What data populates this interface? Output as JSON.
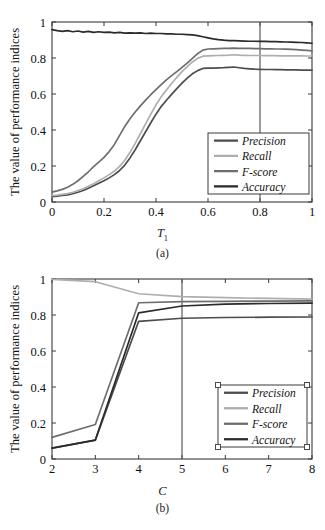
{
  "figure": {
    "ylabel": "The value of performance indices",
    "series_names": [
      "Precision",
      "Recall",
      "F-score",
      "Accuracy"
    ],
    "colors": {
      "precision": "#4d4d4d",
      "recall": "#aeaeae",
      "fscore": "#6e6e6e",
      "accuracy": "#2b2b2b",
      "axis": "#3a3a3a",
      "marker_line": "#5a5a5a",
      "handle_fill": "#ffffff",
      "handle_stroke": "#4a4a4a"
    }
  },
  "chart_data": [
    {
      "type": "line",
      "panel": "(a)",
      "title": "",
      "xlabel": "T1",
      "xlabel_display": "T",
      "xlabel_sub": "1",
      "ylabel": "The value of performance indices",
      "xlim": [
        0,
        1
      ],
      "ylim": [
        0,
        1
      ],
      "xticks": [
        0,
        0.2,
        0.4,
        0.6,
        0.8,
        1
      ],
      "xticklabels": [
        "0",
        "0.2",
        "0.4",
        "0.6",
        "0.8",
        "1"
      ],
      "yticks": [
        0,
        0.2,
        0.4,
        0.6,
        0.8,
        1
      ],
      "yticklabels": [
        "0",
        "0.2",
        "0.4",
        "0.6",
        "0.8",
        "1"
      ],
      "grid": false,
      "legend_position": "lower right",
      "legend_entries": [
        "Precision",
        "Recall",
        "F-score",
        "Accuracy"
      ],
      "annotations": [
        {
          "type": "vertical-line",
          "x": 0.8,
          "label": "0.8"
        }
      ],
      "x": [
        0,
        0.02,
        0.04,
        0.06,
        0.08,
        0.1,
        0.12,
        0.14,
        0.16,
        0.18,
        0.2,
        0.22,
        0.24,
        0.26,
        0.28,
        0.3,
        0.32,
        0.34,
        0.36,
        0.38,
        0.4,
        0.42,
        0.44,
        0.46,
        0.48,
        0.5,
        0.52,
        0.54,
        0.56,
        0.58,
        0.6,
        0.62,
        0.64,
        0.66,
        0.68,
        0.7,
        0.72,
        0.74,
        0.76,
        0.78,
        0.8,
        0.82,
        0.84,
        0.86,
        0.88,
        0.9,
        0.92,
        0.94,
        0.96,
        0.98,
        1.0
      ],
      "series": [
        {
          "name": "Precision",
          "color": "#4d4d4d",
          "values": [
            0.03,
            0.033,
            0.036,
            0.04,
            0.046,
            0.054,
            0.064,
            0.076,
            0.09,
            0.104,
            0.118,
            0.134,
            0.152,
            0.175,
            0.205,
            0.245,
            0.29,
            0.34,
            0.39,
            0.44,
            0.488,
            0.53,
            0.565,
            0.598,
            0.63,
            0.66,
            0.688,
            0.712,
            0.73,
            0.742,
            0.744,
            0.744,
            0.745,
            0.746,
            0.748,
            0.75,
            0.746,
            0.742,
            0.74,
            0.738,
            0.737,
            0.736,
            0.736,
            0.735,
            0.735,
            0.734,
            0.734,
            0.734,
            0.733,
            0.733,
            0.733
          ]
        },
        {
          "name": "Recall",
          "color": "#aeaeae",
          "values": [
            0.035,
            0.038,
            0.042,
            0.047,
            0.054,
            0.063,
            0.074,
            0.087,
            0.102,
            0.118,
            0.134,
            0.152,
            0.172,
            0.198,
            0.232,
            0.276,
            0.326,
            0.38,
            0.434,
            0.488,
            0.54,
            0.584,
            0.622,
            0.658,
            0.692,
            0.724,
            0.752,
            0.778,
            0.798,
            0.81,
            0.812,
            0.813,
            0.814,
            0.815,
            0.816,
            0.818,
            0.816,
            0.815,
            0.814,
            0.814,
            0.814,
            0.813,
            0.813,
            0.813,
            0.812,
            0.812,
            0.812,
            0.812,
            0.812,
            0.811,
            0.811
          ]
        },
        {
          "name": "F-score",
          "color": "#6e6e6e",
          "values": [
            0.055,
            0.062,
            0.07,
            0.082,
            0.098,
            0.118,
            0.142,
            0.168,
            0.196,
            0.222,
            0.248,
            0.28,
            0.32,
            0.37,
            0.42,
            0.462,
            0.5,
            0.534,
            0.566,
            0.596,
            0.624,
            0.652,
            0.678,
            0.702,
            0.724,
            0.748,
            0.772,
            0.798,
            0.824,
            0.844,
            0.85,
            0.851,
            0.852,
            0.853,
            0.854,
            0.855,
            0.854,
            0.853,
            0.853,
            0.852,
            0.852,
            0.851,
            0.851,
            0.85,
            0.85,
            0.849,
            0.848,
            0.846,
            0.844,
            0.842,
            0.84
          ]
        },
        {
          "name": "Accuracy",
          "color": "#2b2b2b",
          "values": [
            0.958,
            0.952,
            0.948,
            0.952,
            0.946,
            0.95,
            0.944,
            0.948,
            0.942,
            0.946,
            0.942,
            0.944,
            0.94,
            0.942,
            0.938,
            0.94,
            0.938,
            0.94,
            0.936,
            0.938,
            0.936,
            0.936,
            0.934,
            0.934,
            0.932,
            0.932,
            0.93,
            0.928,
            0.924,
            0.918,
            0.912,
            0.906,
            0.902,
            0.899,
            0.897,
            0.896,
            0.895,
            0.894,
            0.893,
            0.893,
            0.892,
            0.892,
            0.891,
            0.891,
            0.89,
            0.889,
            0.888,
            0.887,
            0.886,
            0.884,
            0.882
          ]
        }
      ]
    },
    {
      "type": "line",
      "panel": "(b)",
      "title": "",
      "xlabel": "C",
      "ylabel": "The value of performance indices",
      "xlim": [
        2,
        8
      ],
      "ylim": [
        0,
        1
      ],
      "xticks": [
        2,
        3,
        4,
        5,
        6,
        7,
        8
      ],
      "xticklabels": [
        "2",
        "3",
        "4",
        "5",
        "6",
        "7",
        "8"
      ],
      "yticks": [
        0,
        0.2,
        0.4,
        0.6,
        0.8,
        1
      ],
      "yticklabels": [
        "0",
        "0.2",
        "0.4",
        "0.6",
        "0.8",
        "1"
      ],
      "grid": false,
      "legend_position": "lower right",
      "legend_selected": true,
      "legend_entries": [
        "Precision",
        "Recall",
        "F-score",
        "Accuracy"
      ],
      "annotations": [
        {
          "type": "vertical-line",
          "x": 5,
          "label": "5"
        }
      ],
      "x": [
        2,
        3,
        4,
        5,
        6,
        7,
        8
      ],
      "series": [
        {
          "name": "Precision",
          "color": "#4d4d4d",
          "values": [
            0.06,
            0.105,
            0.765,
            0.782,
            0.786,
            0.788,
            0.789
          ]
        },
        {
          "name": "Recall",
          "color": "#aeaeae",
          "values": [
            0.998,
            0.985,
            0.918,
            0.902,
            0.896,
            0.892,
            0.888
          ]
        },
        {
          "name": "F-score",
          "color": "#6e6e6e",
          "values": [
            0.12,
            0.192,
            0.868,
            0.874,
            0.876,
            0.877,
            0.878
          ]
        },
        {
          "name": "Accuracy",
          "color": "#2b2b2b",
          "values": [
            0.06,
            0.105,
            0.812,
            0.85,
            0.86,
            0.864,
            0.866
          ]
        }
      ]
    }
  ],
  "panel_a": {
    "caption": "(a)",
    "xlabel_base": "T",
    "xlabel_sub": "1"
  },
  "panel_b": {
    "caption": "(b)",
    "xlabel": "C"
  }
}
